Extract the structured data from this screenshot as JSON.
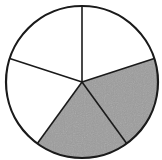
{
  "figure": {
    "total_parts": 5,
    "shaded_parts": 2,
    "fraction": "2/5",
    "colors": {
      "shaded": "#9c9c9c",
      "unshaded": "#ffffff",
      "stroke": "#1a1a1a"
    },
    "center": [
      82,
      82
    ],
    "radius": 76,
    "start_angle_deg": -90,
    "shaded_indices": [
      1,
      2
    ]
  },
  "chart_data": {
    "type": "pie",
    "title": "",
    "categories": [
      "part 1",
      "part 2",
      "part 3",
      "part 4",
      "part 5"
    ],
    "values": [
      1,
      1,
      1,
      1,
      1
    ],
    "shaded": [
      false,
      true,
      true,
      false,
      false
    ]
  }
}
